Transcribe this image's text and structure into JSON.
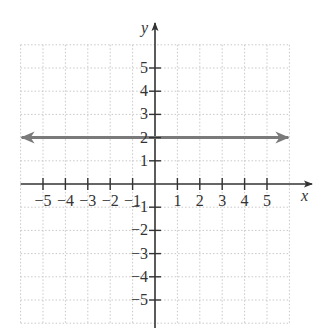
{
  "chart_data": {
    "type": "line",
    "title": "",
    "xlabel": "x",
    "ylabel": "y",
    "xlim": [
      -6,
      6
    ],
    "ylim": [
      -6,
      6
    ],
    "grid": true,
    "grid_style": "dotted",
    "x_ticks": [
      -5,
      -4,
      -3,
      -2,
      -1,
      1,
      2,
      3,
      4,
      5
    ],
    "y_ticks": [
      -5,
      -4,
      -3,
      -2,
      -1,
      1,
      2,
      3,
      4,
      5
    ],
    "x_tick_labels": [
      "−5",
      "−4",
      "−3",
      "−2",
      "−1",
      "1",
      "2",
      "3",
      "4",
      "5"
    ],
    "y_tick_labels": [
      "−5",
      "−4",
      "−3",
      "−2",
      "−1",
      "1",
      "2",
      "3",
      "4",
      "5"
    ],
    "series": [
      {
        "name": "y = 2",
        "equation": "y = 2",
        "x": [
          -6,
          6
        ],
        "y": [
          2,
          2
        ],
        "color": "#7a7a7a",
        "arrows": "both"
      }
    ],
    "legend": null
  },
  "layout": {
    "origin_px": [
      155,
      184
    ],
    "unit_x_px": 22.4,
    "unit_y_px": 23.2,
    "grid_color": "#c8c8c8",
    "axis_color": "#333333",
    "line_color": "#7a7a7a"
  }
}
